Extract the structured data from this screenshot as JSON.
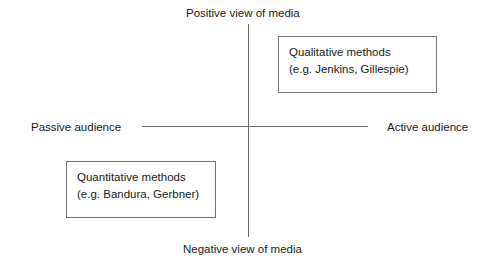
{
  "diagram": {
    "axes": {
      "vertical": {
        "top_label": "Positive view of media",
        "bottom_label": "Negative view of media"
      },
      "horizontal": {
        "left_label": "Passive audience",
        "right_label": "Active audience"
      },
      "line_color": "#6e6e6e"
    },
    "boxes": [
      {
        "id": "qualitative",
        "quadrant": "top-right",
        "line1": "Qualitative methods",
        "line2": "(e.g. Jenkins, Gillespie)",
        "border_color": "#767676"
      },
      {
        "id": "quantitative",
        "quadrant": "bottom-left",
        "line1": "Quantitative methods",
        "line2": "(e.g. Bandura, Gerbner)",
        "border_color": "#767676"
      }
    ],
    "background_color": "#ffffff",
    "text_color": "#1a1a1a"
  }
}
